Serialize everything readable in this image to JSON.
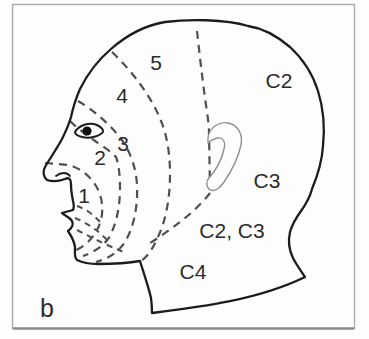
{
  "figure": {
    "panel_label": "b",
    "region_labels": {
      "zone_1": "1",
      "zone_2": "2",
      "zone_3": "3",
      "zone_4": "4",
      "zone_5": "5",
      "c2": "C2",
      "c3": "C3",
      "c2_c3": "C2, C3",
      "c4": "C4"
    },
    "colors": {
      "outline": "#1c1c1c",
      "boundary_dash": "#4f4f4f",
      "ear_stroke": "#909090",
      "frame": "#aaaaaa",
      "frame_bottom": "#8e8e8e",
      "text": "#2b2b2b",
      "background": "#fdfdfd"
    }
  }
}
